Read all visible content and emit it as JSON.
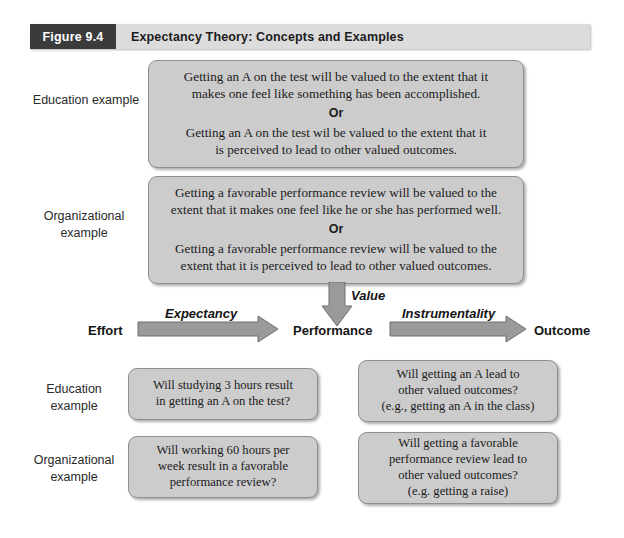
{
  "figure": {
    "number": "Figure 9.4",
    "title": "Expectancy Theory: Concepts and Examples"
  },
  "value_section": {
    "education": {
      "label_line1": "Education",
      "label_line2": "example",
      "para1_line1": "Getting an A on the test will be valued to the extent that it",
      "para1_line2": "makes one feel like something has been accomplished.",
      "connector": "Or",
      "para2_line1": "Getting an A on the test wil be valued to the extent that it",
      "para2_line2": "is perceived to lead to other valued outcomes."
    },
    "organizational": {
      "label_line1": "Organizational",
      "label_line2": "example",
      "para1_line1": "Getting a favorable performance review will be valued to the",
      "para1_line2": "extent that it makes one feel like he or she has performed well.",
      "connector": "Or",
      "para2_line1": "Getting a favorable performance review will be valued to the",
      "para2_line2": "extent that it is perceived to lead to other valued outcomes."
    }
  },
  "flow": {
    "nodes": {
      "effort": "Effort",
      "performance": "Performance",
      "outcome": "Outcome"
    },
    "arrows": {
      "expectancy": "Expectancy",
      "instrumentality": "Instrumentality",
      "value": "Value"
    }
  },
  "examples_section": {
    "education": {
      "label_line1": "Education",
      "label_line2": "example",
      "expectancy_box": {
        "line1": "Will studying 3 hours result",
        "line2": "in getting an A on the test?"
      },
      "instrumentality_box": {
        "line1": "Will getting an A lead to",
        "line2": "other valued outcomes?",
        "line3": "(e.g., getting an A in the class)"
      }
    },
    "organizational": {
      "label_line1": "Organizational",
      "label_line2": "example",
      "expectancy_box": {
        "line1": "Will working 60 hours per",
        "line2": "week result in a  favorable",
        "line3": "performance review?"
      },
      "instrumentality_box": {
        "line1": "Will getting a favorable",
        "line2": "performance review lead to",
        "line3": "other valued outcomes?",
        "line4": "(e.g. getting a raise)"
      }
    }
  },
  "colors": {
    "figure_number_bg": "#3b3b3b",
    "figure_band_bg": "#dcdcdc",
    "box_fill": "#cccccc",
    "box_border": "#8f8f8f",
    "arrow_fill": "#9a9a9a",
    "arrow_stroke": "#6e6e6e",
    "text": "#1b1b1b"
  }
}
